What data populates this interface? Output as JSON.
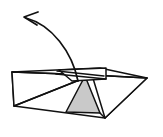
{
  "figure": {
    "kind": "line-drawing",
    "canvas": {
      "width": 163,
      "height": 137,
      "background": "#ffffff"
    },
    "colors": {
      "stroke": "#111111",
      "shaded_face": "#c9c9c9",
      "unshaded_face": "#ffffff",
      "background": "#ffffff"
    },
    "stroke_widths": {
      "outline": 1.6,
      "crease": 1.4,
      "arrow": 1.7,
      "arrow_head": 1.7
    }
  },
  "shapes": {
    "base_body": {
      "label": "base-body",
      "points": "12,72 100,68 147,78 105,118 14,106",
      "fill": "#ffffff"
    },
    "left_wing": {
      "label": "left-wing-panel",
      "points": "12,72 14,106 92,75",
      "fill": "#ffffff"
    },
    "right_wing": {
      "label": "right-wing-panel",
      "points": "92,75 147,78 105,118",
      "fill": "#ffffff"
    },
    "shaded_triangle": {
      "label": "shaded-inner-triangle",
      "points": "85,76 100,113 66,112",
      "fill": "#c9c9c9"
    },
    "top_flap": {
      "label": "top-flap",
      "points": "59,70 106,68 106,79 72,81",
      "fill": "#ffffff"
    }
  },
  "creases": [
    {
      "label": "crease-left-fold",
      "path": "M 14,106 L 92,75"
    },
    {
      "label": "crease-spine",
      "path": "M 12,72 L 92,75"
    },
    {
      "label": "crease-flap-under",
      "path": "M 56,74 L 106,79"
    },
    {
      "label": "crease-flap-edge",
      "path": "M 57,71 L 104,76"
    },
    {
      "label": "crease-right-seam",
      "path": "M 92,75 L 147,78"
    },
    {
      "label": "crease-triangle-left",
      "path": "M 85,76 L 66,112"
    },
    {
      "label": "crease-triangle-right",
      "path": "M 85,76 L 100,113"
    },
    {
      "label": "crease-bottom-right",
      "path": "M 100,113 L 105,118"
    }
  ],
  "arrow": {
    "label": "fold-motion-arrow",
    "direction": "counter-clockwise-up-left",
    "arc_path": "M 78,81 C 72,52 52,25 26,18",
    "head_path": "M 38,12 L 24,17 L 37,25",
    "tip": {
      "x": 24,
      "y": 17
    },
    "tail": {
      "x": 78,
      "y": 81
    }
  },
  "accessibility": {
    "alt": "Technical origami diagram: a flat folded paper form seen in perspective with a narrow flap on top, a light grey shaded triangular facet at the centre bottom, and a long curved arrow sweeping from the flap upward and to the left indicating the direction of the next fold."
  }
}
